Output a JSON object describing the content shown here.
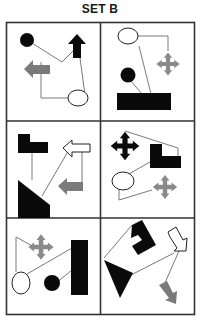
{
  "title": "SET B",
  "colors": {
    "black": "#0a0a0a",
    "gray": "#7a7a7a",
    "line": "#7a7a7a",
    "border": "#333333",
    "white": "#ffffff"
  },
  "grid": {
    "rows": 3,
    "cols": 2
  },
  "cells": [
    {
      "position": "row1-col1",
      "shapes": [
        "black-circle",
        "black-up-arrow",
        "gray-left-arrow",
        "white-ellipse"
      ],
      "connections": [
        "black-circle to black-up-arrow",
        "gray-left-arrow to white-ellipse",
        "white-ellipse to black-up-arrow"
      ]
    },
    {
      "position": "row1-col2",
      "shapes": [
        "white-ellipse",
        "gray-cross-star",
        "black-circle",
        "black-rectangle"
      ],
      "connections": [
        "white-ellipse to gray-cross-star",
        "white-ellipse to black-rectangle",
        "black-circle to black-rectangle"
      ]
    },
    {
      "position": "row2-col1",
      "shapes": [
        "black-l-shape",
        "white-left-arrow",
        "black-triangle",
        "gray-left-arrow"
      ],
      "connections": [
        "black-l-shape to black-triangle",
        "black-triangle to white-left-arrow",
        "white-left-arrow to gray-left-arrow"
      ]
    },
    {
      "position": "row2-col2",
      "shapes": [
        "black-cross-star",
        "black-l-shape",
        "white-ellipse",
        "gray-cross-star"
      ],
      "connections": [
        "black-cross-star to black-l-shape",
        "black-l-shape to white-ellipse",
        "white-ellipse to gray-cross-star"
      ]
    },
    {
      "position": "row3-col1",
      "shapes": [
        "gray-cross-star",
        "white-ellipse",
        "black-circle",
        "black-tall-rectangle"
      ],
      "connections": [
        "gray-cross-star to white-ellipse",
        "white-ellipse to black-tall-rectangle",
        "black-circle to black-tall-rectangle"
      ]
    },
    {
      "position": "row3-col2",
      "shapes": [
        "black-l-shape-rotated",
        "black-triangle",
        "white-arrow-diagonal",
        "gray-arrow-diagonal"
      ],
      "connections": [
        "black-l-shape-rotated to black-triangle",
        "black-triangle to white-arrow-diagonal",
        "white-arrow-diagonal to gray-arrow-diagonal"
      ]
    }
  ]
}
